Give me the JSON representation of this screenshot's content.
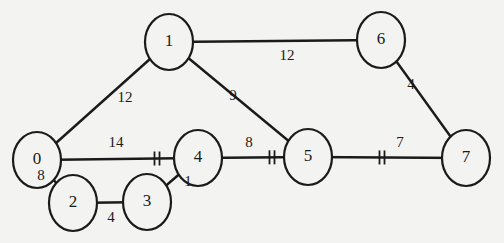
{
  "diagram": {
    "type": "weighted-undirected-graph",
    "colors": {
      "background": "#f3f3f1",
      "stroke": "#1a1a1a"
    },
    "nodes": [
      {
        "id": "0",
        "label": "0",
        "cx": 37,
        "cy": 160
      },
      {
        "id": "1",
        "label": "1",
        "cx": 169,
        "cy": 42
      },
      {
        "id": "2",
        "label": "2",
        "cx": 73,
        "cy": 203
      },
      {
        "id": "3",
        "label": "3",
        "cx": 147,
        "cy": 202
      },
      {
        "id": "4",
        "label": "4",
        "cx": 198,
        "cy": 158
      },
      {
        "id": "5",
        "label": "5",
        "cx": 308,
        "cy": 157
      },
      {
        "id": "6",
        "label": "6",
        "cx": 381,
        "cy": 40
      },
      {
        "id": "7",
        "label": "7",
        "cx": 466,
        "cy": 158
      }
    ],
    "edges": [
      {
        "from": "0",
        "to": "1",
        "weight": "12",
        "lx": 125,
        "ly": 97,
        "cut": false
      },
      {
        "from": "1",
        "to": "6",
        "weight": "12",
        "lx": 287,
        "ly": 55,
        "cut": false
      },
      {
        "from": "1",
        "to": "5",
        "weight": "9",
        "lx": 233,
        "ly": 95,
        "cut": false
      },
      {
        "from": "6",
        "to": "7",
        "weight": "4",
        "lx": 411,
        "ly": 84,
        "cut": false
      },
      {
        "from": "0",
        "to": "4",
        "weight": "14",
        "lx": 116,
        "ly": 142,
        "cut": true,
        "cutx": 157
      },
      {
        "from": "4",
        "to": "5",
        "weight": "8",
        "lx": 249,
        "ly": 142,
        "cut": true,
        "cutx": 272
      },
      {
        "from": "5",
        "to": "7",
        "weight": "7",
        "lx": 400,
        "ly": 142,
        "cut": true,
        "cutx": 382
      },
      {
        "from": "0",
        "to": "2",
        "weight": "8",
        "lx": 41,
        "ly": 175,
        "cut": false
      },
      {
        "from": "2",
        "to": "3",
        "weight": "4",
        "lx": 111,
        "ly": 217,
        "cut": false
      },
      {
        "from": "3",
        "to": "4",
        "weight": "1",
        "lx": 188,
        "ly": 181,
        "cut": false
      }
    ]
  }
}
